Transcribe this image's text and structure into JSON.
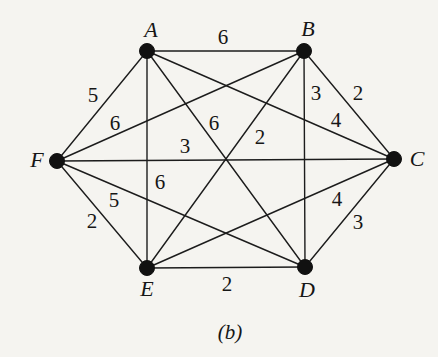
{
  "page": {
    "background": "#f5f4f0",
    "ink": "#1c1c1c"
  },
  "caption": "(b)",
  "graph": {
    "type": "weighted-undirected-complete-graph-K6",
    "nodes": [
      {
        "id": "A",
        "x": 147,
        "y": 51,
        "label_x": 151,
        "label_y": 37
      },
      {
        "id": "B",
        "x": 304,
        "y": 51,
        "label_x": 308,
        "label_y": 36
      },
      {
        "id": "C",
        "x": 394,
        "y": 159,
        "label_x": 417,
        "label_y": 166
      },
      {
        "id": "D",
        "x": 305,
        "y": 267,
        "label_x": 307,
        "label_y": 297
      },
      {
        "id": "E",
        "x": 147,
        "y": 268,
        "label_x": 147,
        "label_y": 296
      },
      {
        "id": "F",
        "x": 57,
        "y": 161,
        "label_x": 37,
        "label_y": 167
      }
    ],
    "edges": [
      {
        "from": "A",
        "to": "B",
        "weight": "6",
        "label_x": 223,
        "label_y": 37
      },
      {
        "from": "A",
        "to": "C",
        "weight": "4",
        "label_x": 336,
        "label_y": 120
      },
      {
        "from": "A",
        "to": "D",
        "weight": "6",
        "label_x": 214,
        "label_y": 123
      },
      {
        "from": "A",
        "to": "E",
        "weight": "6",
        "label_x": 160,
        "label_y": 182
      },
      {
        "from": "A",
        "to": "F",
        "weight": "5",
        "label_x": 93,
        "label_y": 95
      },
      {
        "from": "B",
        "to": "C",
        "weight": "2",
        "label_x": 358,
        "label_y": 93
      },
      {
        "from": "B",
        "to": "D",
        "weight": "3",
        "label_x": 316,
        "label_y": 93
      },
      {
        "from": "B",
        "to": "E",
        "weight": "2",
        "label_x": 260,
        "label_y": 137
      },
      {
        "from": "B",
        "to": "F",
        "weight": "6",
        "label_x": 115,
        "label_y": 123
      },
      {
        "from": "C",
        "to": "D",
        "weight": "3",
        "label_x": 358,
        "label_y": 222
      },
      {
        "from": "C",
        "to": "E",
        "weight": "4",
        "label_x": 337,
        "label_y": 199
      },
      {
        "from": "C",
        "to": "F",
        "weight": "3",
        "label_x": 185,
        "label_y": 146
      },
      {
        "from": "D",
        "to": "E",
        "weight": "2",
        "label_x": 227,
        "label_y": 284
      },
      {
        "from": "D",
        "to": "F",
        "weight": "5",
        "label_x": 114,
        "label_y": 200
      },
      {
        "from": "E",
        "to": "F",
        "weight": "2",
        "label_x": 92,
        "label_y": 221
      }
    ],
    "node_radius": 7.5
  }
}
